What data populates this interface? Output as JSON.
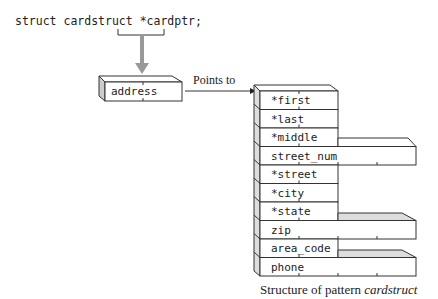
{
  "declaration": {
    "prefix": "struct cardstruct ",
    "pointer": "*cardptr;"
  },
  "pointer_box": {
    "label": "address"
  },
  "arrow_label": "Points to",
  "structure": {
    "fields": [
      {
        "name": "*first",
        "width": "narrow"
      },
      {
        "name": "*last",
        "width": "narrow"
      },
      {
        "name": "*middle",
        "width": "narrow"
      },
      {
        "name": "street_num",
        "width": "wide"
      },
      {
        "name": "*street",
        "width": "narrow"
      },
      {
        "name": "*city",
        "width": "narrow"
      },
      {
        "name": "*state",
        "width": "narrow"
      },
      {
        "name": "zip",
        "width": "wide"
      },
      {
        "name": "area_code",
        "width": "narrow"
      },
      {
        "name": "phone",
        "width": "wide"
      }
    ]
  },
  "caption": {
    "prefix": "Structure of pattern ",
    "emphasis": "cardstruct"
  }
}
